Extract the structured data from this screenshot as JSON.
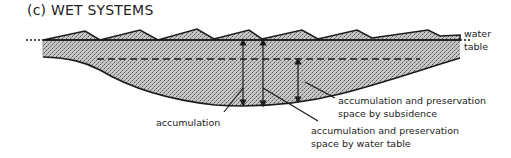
{
  "figure": {
    "panel_tag": "(c)",
    "title": "WET SYSTEMS"
  },
  "labels": {
    "water_table_line1": "water",
    "water_table_line2": "table",
    "accumulation": "accumulation",
    "subsidence_line1": "accumulation and preservation",
    "subsidence_line2": "space by subsidence",
    "water_table_space_line1": "accumulation and preservation",
    "water_table_space_line2": "space by water table"
  },
  "colors": {
    "ink": "#1a1a1a",
    "sediment_fill": "#b9b9b9"
  }
}
